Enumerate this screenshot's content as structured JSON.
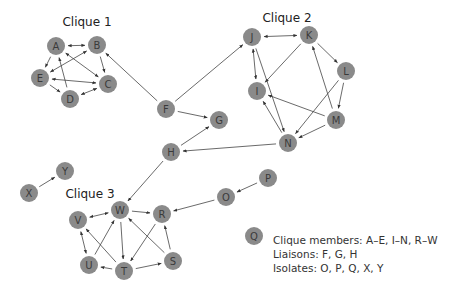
{
  "diagram": {
    "type": "directed-network",
    "node_color": "#8a8a8a",
    "edge_color": "#444444",
    "node_radius": 9,
    "clique_labels": [
      {
        "label": "Clique 1",
        "x": 87,
        "y": 26
      },
      {
        "label": "Clique 2",
        "x": 287,
        "y": 22
      },
      {
        "label": "Clique 3",
        "x": 90,
        "y": 198
      }
    ],
    "nodes": [
      {
        "id": "A",
        "x": 56,
        "y": 46
      },
      {
        "id": "B",
        "x": 97,
        "y": 45
      },
      {
        "id": "C",
        "x": 108,
        "y": 84
      },
      {
        "id": "D",
        "x": 70,
        "y": 99
      },
      {
        "id": "E",
        "x": 40,
        "y": 78
      },
      {
        "id": "F",
        "x": 166,
        "y": 109
      },
      {
        "id": "G",
        "x": 219,
        "y": 120
      },
      {
        "id": "H",
        "x": 171,
        "y": 152
      },
      {
        "id": "I",
        "x": 257,
        "y": 91
      },
      {
        "id": "J",
        "x": 252,
        "y": 37
      },
      {
        "id": "K",
        "x": 309,
        "y": 35
      },
      {
        "id": "L",
        "x": 346,
        "y": 71
      },
      {
        "id": "M",
        "x": 336,
        "y": 120
      },
      {
        "id": "N",
        "x": 288,
        "y": 143
      },
      {
        "id": "O",
        "x": 226,
        "y": 197
      },
      {
        "id": "P",
        "x": 268,
        "y": 178
      },
      {
        "id": "Q",
        "x": 254,
        "y": 236
      },
      {
        "id": "R",
        "x": 162,
        "y": 214
      },
      {
        "id": "S",
        "x": 173,
        "y": 261
      },
      {
        "id": "T",
        "x": 124,
        "y": 271
      },
      {
        "id": "U",
        "x": 89,
        "y": 265
      },
      {
        "id": "V",
        "x": 78,
        "y": 220
      },
      {
        "id": "W",
        "x": 120,
        "y": 210
      },
      {
        "id": "X",
        "x": 29,
        "y": 193
      },
      {
        "id": "Y",
        "x": 65,
        "y": 171
      }
    ],
    "edges": [
      {
        "from": "A",
        "to": "B",
        "bidirectional": true
      },
      {
        "from": "A",
        "to": "E",
        "bidirectional": false
      },
      {
        "from": "D",
        "to": "A",
        "bidirectional": false
      },
      {
        "from": "A",
        "to": "C",
        "bidirectional": true
      },
      {
        "from": "B",
        "to": "C",
        "bidirectional": false
      },
      {
        "from": "E",
        "to": "B",
        "bidirectional": true
      },
      {
        "from": "E",
        "to": "C",
        "bidirectional": true
      },
      {
        "from": "E",
        "to": "D",
        "bidirectional": false
      },
      {
        "from": "D",
        "to": "C",
        "bidirectional": true
      },
      {
        "from": "F",
        "to": "B",
        "bidirectional": false
      },
      {
        "from": "F",
        "to": "J",
        "bidirectional": false
      },
      {
        "from": "F",
        "to": "G",
        "bidirectional": false
      },
      {
        "from": "H",
        "to": "G",
        "bidirectional": false
      },
      {
        "from": "N",
        "to": "H",
        "bidirectional": false
      },
      {
        "from": "H",
        "to": "W",
        "bidirectional": false
      },
      {
        "from": "J",
        "to": "K",
        "bidirectional": true
      },
      {
        "from": "J",
        "to": "I",
        "bidirectional": true
      },
      {
        "from": "K",
        "to": "I",
        "bidirectional": false
      },
      {
        "from": "J",
        "to": "N",
        "bidirectional": false
      },
      {
        "from": "N",
        "to": "I",
        "bidirectional": false
      },
      {
        "from": "M",
        "to": "I",
        "bidirectional": false
      },
      {
        "from": "K",
        "to": "L",
        "bidirectional": false
      },
      {
        "from": "L",
        "to": "M",
        "bidirectional": false
      },
      {
        "from": "M",
        "to": "K",
        "bidirectional": false
      },
      {
        "from": "L",
        "to": "N",
        "bidirectional": false
      },
      {
        "from": "M",
        "to": "N",
        "bidirectional": false
      },
      {
        "from": "P",
        "to": "O",
        "bidirectional": false
      },
      {
        "from": "O",
        "to": "R",
        "bidirectional": false
      },
      {
        "from": "X",
        "to": "Y",
        "bidirectional": false
      },
      {
        "from": "V",
        "to": "W",
        "bidirectional": true
      },
      {
        "from": "V",
        "to": "U",
        "bidirectional": true
      },
      {
        "from": "U",
        "to": "W",
        "bidirectional": false
      },
      {
        "from": "T",
        "to": "V",
        "bidirectional": false
      },
      {
        "from": "W",
        "to": "T",
        "bidirectional": false
      },
      {
        "from": "T",
        "to": "U",
        "bidirectional": false
      },
      {
        "from": "S",
        "to": "W",
        "bidirectional": false
      },
      {
        "from": "R",
        "to": "T",
        "bidirectional": false
      },
      {
        "from": "S",
        "to": "R",
        "bidirectional": false
      },
      {
        "from": "T",
        "to": "S",
        "bidirectional": false
      },
      {
        "from": "W",
        "to": "R",
        "bidirectional": false
      }
    ]
  },
  "legend": {
    "clique_members": "Clique members: A–E, I–N, R–W",
    "liaisons": "Liaisons: F, G, H",
    "isolates": "Isolates: O, P, Q, X, Y"
  }
}
